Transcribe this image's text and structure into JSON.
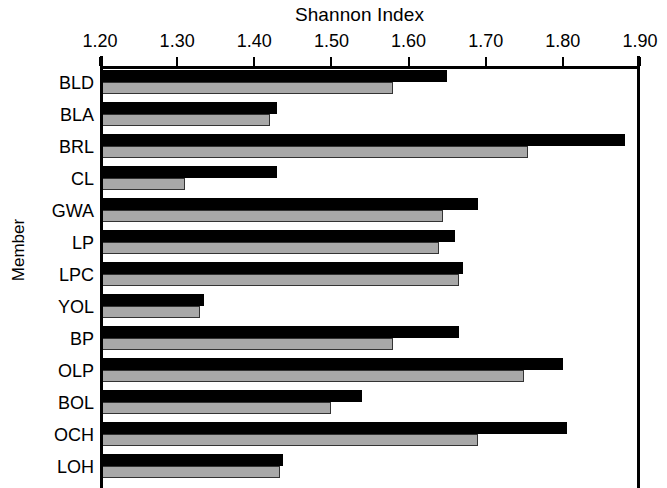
{
  "chart_data": {
    "type": "bar",
    "orientation": "horizontal",
    "title": "Shannon Index",
    "xlabel": "Shannon Index",
    "ylabel": "Member",
    "xlim": [
      1.2,
      1.9
    ],
    "xticks": [
      1.2,
      1.3,
      1.4,
      1.5,
      1.6,
      1.7,
      1.8,
      1.9
    ],
    "xtick_labels": [
      "1.20",
      "1.30",
      "1.40",
      "1.50",
      "1.60",
      "1.70",
      "1.80",
      "1.90"
    ],
    "grid": false,
    "legend": null,
    "categories": [
      "BLD",
      "BLA",
      "BRL",
      "CL",
      "GWA",
      "LP",
      "LPC",
      "YOL",
      "BP",
      "OLP",
      "BOL",
      "OCH",
      "LOH"
    ],
    "series": [
      {
        "name": "black",
        "color": "#000000",
        "values": [
          1.65,
          1.43,
          1.88,
          1.43,
          1.69,
          1.66,
          1.67,
          1.335,
          1.665,
          1.8,
          1.54,
          1.805,
          1.437
        ]
      },
      {
        "name": "gray",
        "color": "#a8a8a8",
        "values": [
          1.58,
          1.42,
          1.755,
          1.31,
          1.645,
          1.64,
          1.665,
          1.33,
          1.58,
          1.75,
          1.5,
          1.69,
          1.433
        ]
      }
    ]
  },
  "axis": {
    "title": "Shannon Index",
    "y_title": "Member"
  }
}
